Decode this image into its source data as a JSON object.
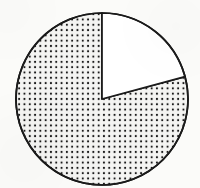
{
  "figure": {
    "kind": "pie-chart",
    "title": "",
    "caption": "",
    "background_color": "#fbfbf9",
    "stroke_color": "#1a1a1a",
    "stroke_width": 1.7
  },
  "geometry": {
    "center_x": 102,
    "center_y": 99,
    "radius": 86,
    "start_angle_deg": 0,
    "split_angle_deg": 75
  },
  "pattern": {
    "name": "dotted-stipple",
    "dot_color": "#151515",
    "fill_color": "#f4f4f2",
    "dot_radius": 1.05,
    "spacing": 5.3
  },
  "chart_data": {
    "type": "pie",
    "title": "",
    "subtitle": "",
    "xlabel": "",
    "ylabel": "",
    "grid": false,
    "legend_position": "none",
    "start_angle_deg": 90,
    "direction": "clockwise",
    "categories": [
      "Slice A",
      "Slice B"
    ],
    "values": [
      20.8,
      79.2
    ],
    "units": "percent",
    "slices": [
      {
        "label": "Slice A",
        "value": 20.8,
        "angle_deg": 75,
        "fill": "white",
        "pattern": "none",
        "outline": "#1a1a1a",
        "start_deg": 0,
        "end_deg": 75
      },
      {
        "label": "Slice B",
        "value": 79.2,
        "angle_deg": 285,
        "fill": "#f4f4f2",
        "pattern": "dotted-stipple",
        "outline": "#1a1a1a",
        "start_deg": 75,
        "end_deg": 360
      }
    ],
    "annotations": [],
    "tick_labels": [],
    "data_labels": []
  }
}
